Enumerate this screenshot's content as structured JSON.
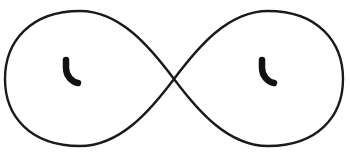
{
  "figure": {
    "title": "Infinity symbol with two hook marks",
    "type": "line-drawing",
    "canvas": {
      "width": 350,
      "height": 159,
      "background_color": "#ffffff"
    },
    "curve": {
      "name": "lemniscate",
      "description": "Figure-eight / infinity outline crossing at the center",
      "stroke_color": "#1a1a1a",
      "fill_color": "none",
      "stroke_width": 2.4,
      "crossing_point": {
        "x": 174,
        "y": 79
      },
      "bounds": {
        "left": 5,
        "top": 11,
        "right": 343,
        "bottom": 146
      },
      "left_lobe_center": {
        "x": 90,
        "y": 79
      },
      "right_lobe_center": {
        "x": 258,
        "y": 79
      },
      "path": "M 174 79 C 150 47, 120 11, 80 11 C 30 11, 5 42, 5 79 C 5 116, 30 146, 80 146 C 120 146, 150 111, 174 79 C 198 47, 228 11, 268 11 C 318 11, 343 42, 343 79 C 343 116, 318 146, 268 146 C 228 146, 198 111, 174 79 Z"
    },
    "marks": [
      {
        "name": "left-hook-mark",
        "shape": "quarter-arc-hook",
        "fill_color": "#111111",
        "stroke_width": 6.5,
        "bounds": {
          "left": 62,
          "top": 57,
          "right": 81,
          "bottom": 86
        },
        "path": "M 66 60 L 66 68 C 66 76, 72 82, 78 83"
      },
      {
        "name": "right-hook-mark",
        "shape": "quarter-arc-hook",
        "fill_color": "#111111",
        "stroke_width": 6.5,
        "bounds": {
          "left": 258,
          "top": 57,
          "right": 277,
          "bottom": 86
        },
        "path": "M 262 60 L 262 68 C 262 76, 268 82, 274 83"
      }
    ]
  }
}
